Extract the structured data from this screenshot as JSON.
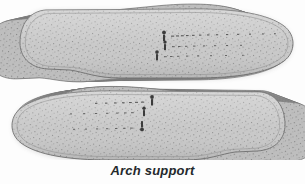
{
  "figure": {
    "caption": "Arch support",
    "alt_label": "stacked-insoles-illustration",
    "background_color": "#fdfdfd",
    "insole_fill_color": "#c6c6c6",
    "insole_outline_color": "#6f6f6f",
    "insole_stitch_color": "#8d8d8d",
    "speckle_color": "#7a7a7a",
    "shadow_color": "#bdbdbd",
    "caption_color": "#24292c",
    "stack_layer_count": 13,
    "insoles": [
      {
        "name": "upper-insole",
        "orientation": "heel-left-toe-right",
        "stack_side": "right",
        "markings_label": "size markings"
      },
      {
        "name": "lower-insole",
        "orientation": "toe-left-heel-right",
        "stack_side": "left",
        "markings_label": "size markings"
      }
    ]
  }
}
